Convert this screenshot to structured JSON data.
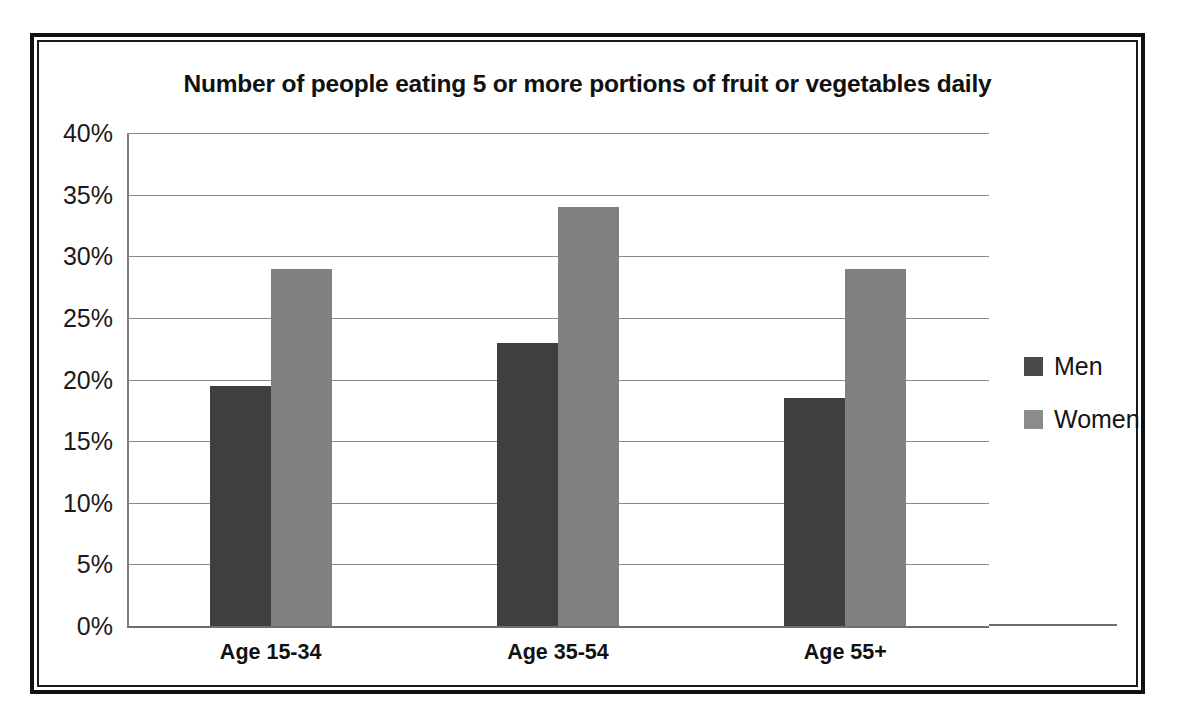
{
  "chart_data": {
    "type": "bar",
    "title": "Number of people eating 5 or more portions of fruit or vegetables daily",
    "xlabel": "",
    "ylabel": "",
    "categories": [
      "Age 15-34",
      "Age 35-54",
      "Age 55+"
    ],
    "series": [
      {
        "name": "Men",
        "color": "#3f3f3f",
        "values": [
          19.5,
          23,
          18.5
        ]
      },
      {
        "name": "Women",
        "color": "#808080",
        "values": [
          29,
          34,
          29
        ]
      }
    ],
    "ylim": [
      0,
      40
    ],
    "ytick_step": 5,
    "ytick_labels": [
      "40%",
      "35%",
      "30%",
      "25%",
      "20%",
      "15%",
      "10%",
      "5%",
      "0%"
    ],
    "ytick_values": [
      40,
      35,
      30,
      25,
      20,
      15,
      10,
      5,
      0
    ],
    "value_suffix": "%",
    "grid": true,
    "legend_position": "right"
  },
  "frame": {
    "border_color": "#111111",
    "background": "#ffffff"
  }
}
